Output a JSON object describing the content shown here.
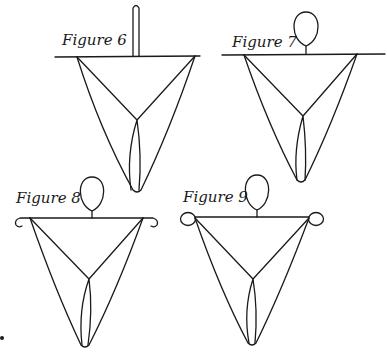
{
  "figures": [
    {
      "label": "Figure 6",
      "top_element": "vertical-rod"
    },
    {
      "label": "Figure 7",
      "top_element": "head-loop"
    },
    {
      "label": "Figure 8",
      "top_element": "head-loop",
      "ends": "hooks"
    },
    {
      "label": "Figure 9",
      "top_element": "head-loop",
      "ends": "rings"
    }
  ],
  "colors": {
    "ink": "#1a1a1a",
    "background": "#ffffff"
  }
}
